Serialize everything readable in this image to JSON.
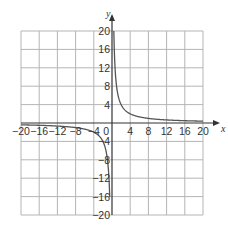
{
  "chart_data": {
    "type": "line",
    "title": "",
    "xlabel": "x",
    "ylabel": "y",
    "xlim": [
      -20,
      20
    ],
    "ylim": [
      -20,
      20
    ],
    "grid": true,
    "grid_step": 4,
    "x_ticks": [
      "-20",
      "-16",
      "-12",
      "-8",
      "-4",
      "4",
      "8",
      "12",
      "16",
      "20"
    ],
    "y_ticks": [
      "20",
      "16",
      "12",
      "8",
      "4",
      "-4",
      "-8",
      "-12",
      "-16",
      "-20"
    ],
    "origin_label": "0",
    "series": [
      {
        "name": "y = 8/x (x > 0)",
        "function": "8/x",
        "x": [
          0.4,
          0.5,
          1,
          2,
          4,
          8,
          12,
          16,
          20
        ],
        "values": [
          20,
          16,
          8,
          4,
          2,
          1,
          0.67,
          0.5,
          0.4
        ]
      },
      {
        "name": "y = 8/x (x < 0)",
        "function": "8/x",
        "x": [
          -20,
          -16,
          -12,
          -8,
          -4,
          -2,
          -1,
          -0.5,
          -0.4
        ],
        "values": [
          -0.4,
          -0.5,
          -0.67,
          -1,
          -2,
          -4,
          -8,
          -16,
          -20
        ]
      }
    ],
    "colors": {
      "grid": "#b5b5b5",
      "axis": "#333333",
      "curve": "#555555"
    }
  }
}
